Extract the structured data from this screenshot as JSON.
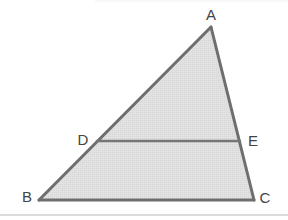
{
  "diagram": {
    "type": "triangle-with-parallel-segment",
    "fill_color": "#dcdcdc",
    "stroke_color": "#6e6e6e",
    "vertices": {
      "A": {
        "label": "A",
        "x": 211,
        "y": 27,
        "lx": 211,
        "ly": 20
      },
      "B": {
        "label": "B",
        "x": 39,
        "y": 200,
        "lx": 27,
        "ly": 202
      },
      "C": {
        "label": "C",
        "x": 254,
        "y": 200,
        "lx": 265,
        "ly": 203
      },
      "D": {
        "label": "D",
        "x": 97,
        "y": 141,
        "lx": 83,
        "ly": 145
      },
      "E": {
        "label": "E",
        "x": 240,
        "y": 141,
        "lx": 253,
        "ly": 146
      }
    },
    "segments": [
      {
        "from": "A",
        "to": "B"
      },
      {
        "from": "A",
        "to": "C"
      },
      {
        "from": "B",
        "to": "C"
      },
      {
        "from": "D",
        "to": "E"
      }
    ]
  }
}
